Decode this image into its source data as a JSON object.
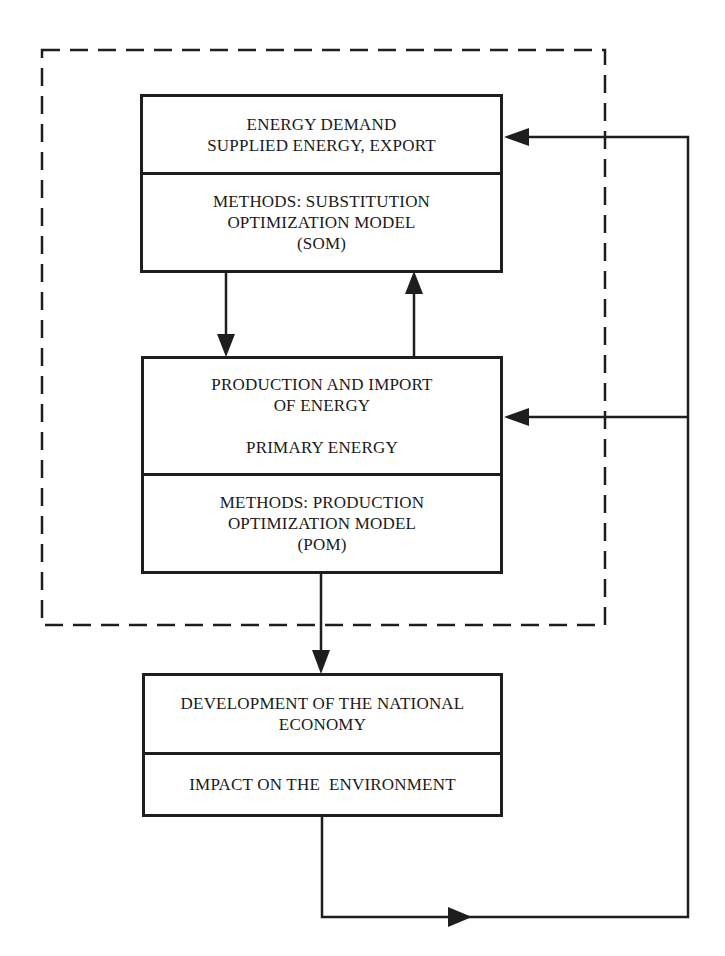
{
  "diagram": {
    "boxes": [
      {
        "id": "som",
        "sections": [
          {
            "lines": [
              "ENERGY DEMAND",
              "SUPPLIED ENERGY, EXPORT"
            ]
          },
          {
            "lines": [
              "METHODS: SUBSTITUTION",
              "OPTIMIZATION MODEL",
              "(SOM)"
            ]
          }
        ]
      },
      {
        "id": "pom",
        "sections": [
          {
            "lines": [
              "PRODUCTION AND IMPORT",
              "OF ENERGY",
              "",
              "PRIMARY ENERGY"
            ]
          },
          {
            "lines": [
              "METHODS: PRODUCTION",
              "OPTIMIZATION MODEL",
              "(POM)"
            ]
          }
        ]
      },
      {
        "id": "economy",
        "sections": [
          {
            "lines": [
              "DEVELOPMENT OF THE NATIONAL",
              "ECONOMY"
            ]
          },
          {
            "lines": [
              "IMPACT ON THE  ENVIRONMENT"
            ]
          }
        ]
      }
    ],
    "connections": [
      {
        "from": "som",
        "to": "pom",
        "style": "arrow"
      },
      {
        "from": "pom",
        "to": "som",
        "style": "arrow"
      },
      {
        "from": "pom",
        "to": "economy",
        "style": "arrow"
      },
      {
        "from": "economy",
        "to": "som",
        "style": "feedback-arrow"
      },
      {
        "from": "economy",
        "to": "pom",
        "style": "feedback-arrow"
      }
    ],
    "group": {
      "encloses": [
        "som",
        "pom"
      ],
      "style": "dashed"
    },
    "colors": {
      "line": "#1e1e1e",
      "background": "#ffffff"
    }
  }
}
